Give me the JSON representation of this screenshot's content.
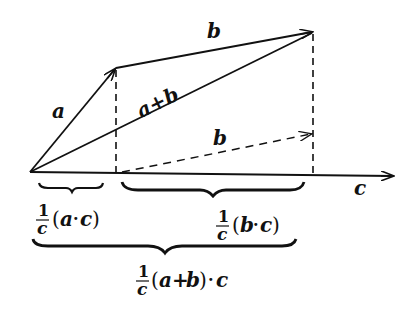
{
  "diagram": {
    "labels": {
      "a": "a",
      "b_top": "b",
      "a_plus_b": "a+b",
      "b_dashed": "b",
      "c": "c"
    },
    "brace_labels": {
      "proj_a": {
        "numerator": "1",
        "denominator": "c",
        "expr_open": "(",
        "expr_var1": "a",
        "expr_op": "·",
        "expr_var2": "c",
        "expr_close": ")"
      },
      "proj_b": {
        "numerator": "1",
        "denominator": "c",
        "expr_open": "(",
        "expr_var1": "b",
        "expr_op": "·",
        "expr_var2": "c",
        "expr_close": ")"
      },
      "proj_sum": {
        "numerator": "1",
        "denominator": "c",
        "expr_open": "(",
        "expr_var1": "a",
        "expr_op1": "+",
        "expr_var2": "b",
        "expr_close": ")",
        "expr_op2": "·",
        "expr_var3": "c"
      }
    },
    "points": {
      "origin": [
        30,
        172
      ],
      "a_tip": [
        116,
        68
      ],
      "sum_tip": [
        313,
        32
      ],
      "b_dashed_start": [
        116,
        172
      ],
      "b_dashed_tip": [
        313,
        134
      ],
      "c_tip": [
        394,
        176
      ]
    },
    "colors": {
      "stroke": "#111111",
      "background": "#ffffff"
    }
  }
}
